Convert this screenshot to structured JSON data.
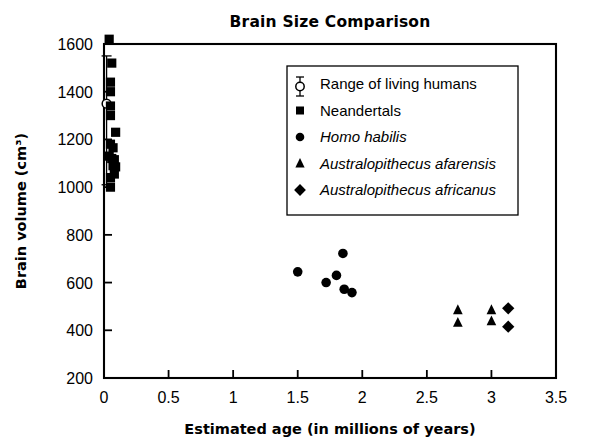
{
  "chart_data": {
    "type": "scatter",
    "title": "Brain Size Comparison",
    "xlabel": "Estimated age (in millions of years)",
    "ylabel": "Brain volume (cm³)",
    "xlim": [
      0,
      3.5
    ],
    "ylim": [
      200,
      1600
    ],
    "xticks": [
      "0",
      "0.5",
      "1",
      "1.5",
      "2",
      "2.5",
      "3",
      "3.5"
    ],
    "xtick_values": [
      0,
      0.5,
      1,
      1.5,
      2,
      2.5,
      3,
      3.5
    ],
    "yticks": [
      "200",
      "400",
      "600",
      "800",
      "1000",
      "1200",
      "1400",
      "1600"
    ],
    "ytick_values": [
      200,
      400,
      600,
      800,
      1000,
      1200,
      1400,
      1600
    ],
    "grid": false,
    "legend_position": "upper center",
    "series": [
      {
        "name": "Range of living humans",
        "marker": "open-circle-errorbar",
        "italic": false,
        "points": [
          {
            "x": 0.02,
            "y": 1350
          }
        ],
        "error_bar": {
          "x": 0.02,
          "low": 1010,
          "high": 1550
        }
      },
      {
        "name": "Neandertals",
        "marker": "square",
        "italic": false,
        "points": [
          {
            "x": 0.04,
            "y": 1620
          },
          {
            "x": 0.06,
            "y": 1520
          },
          {
            "x": 0.05,
            "y": 1440
          },
          {
            "x": 0.05,
            "y": 1400
          },
          {
            "x": 0.05,
            "y": 1340
          },
          {
            "x": 0.05,
            "y": 1300
          },
          {
            "x": 0.09,
            "y": 1230
          },
          {
            "x": 0.05,
            "y": 1180
          },
          {
            "x": 0.07,
            "y": 1165
          },
          {
            "x": 0.04,
            "y": 1130
          },
          {
            "x": 0.06,
            "y": 1120
          },
          {
            "x": 0.08,
            "y": 1115
          },
          {
            "x": 0.07,
            "y": 1090
          },
          {
            "x": 0.09,
            "y": 1085
          },
          {
            "x": 0.08,
            "y": 1055
          },
          {
            "x": 0.05,
            "y": 1040
          },
          {
            "x": 0.05,
            "y": 1000
          }
        ]
      },
      {
        "name": "Homo habilis",
        "marker": "circle",
        "italic": true,
        "points": [
          {
            "x": 1.5,
            "y": 645
          },
          {
            "x": 1.72,
            "y": 600
          },
          {
            "x": 1.8,
            "y": 630
          },
          {
            "x": 1.85,
            "y": 722
          },
          {
            "x": 1.86,
            "y": 572
          },
          {
            "x": 1.92,
            "y": 558
          }
        ]
      },
      {
        "name": "Australopithecus afarensis",
        "marker": "triangle",
        "italic": true,
        "points": [
          {
            "x": 2.74,
            "y": 485
          },
          {
            "x": 2.74,
            "y": 432
          },
          {
            "x": 3.0,
            "y": 485
          },
          {
            "x": 3.0,
            "y": 438
          }
        ]
      },
      {
        "name": "Australopithecus africanus",
        "marker": "diamond",
        "italic": true,
        "points": [
          {
            "x": 3.13,
            "y": 492
          },
          {
            "x": 3.13,
            "y": 415
          }
        ]
      }
    ]
  },
  "colors": {
    "foreground": "#000000",
    "background": "#ffffff"
  }
}
